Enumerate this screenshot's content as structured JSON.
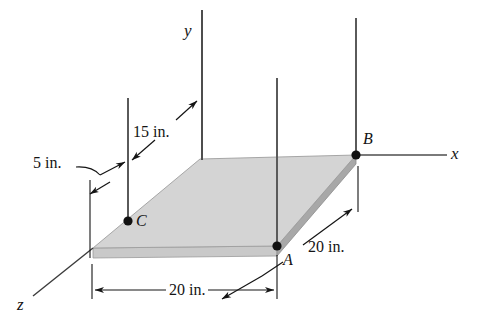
{
  "figure": {
    "type": "engineering-free-body-diagram"
  },
  "axes": {
    "x": {
      "label": "x"
    },
    "y": {
      "label": "y"
    },
    "z": {
      "label": "z"
    }
  },
  "points": [
    {
      "id": "A",
      "label": "A"
    },
    {
      "id": "B",
      "label": "B"
    },
    {
      "id": "C",
      "label": "C"
    }
  ],
  "dimensions": [
    {
      "id": "depth-bottom",
      "label": "20 in."
    },
    {
      "id": "width-right",
      "label": "20 in."
    },
    {
      "id": "offset-cable",
      "label": "15 in."
    },
    {
      "id": "offset-edge",
      "label": "5 in."
    }
  ],
  "colors": {
    "plate_top": "#d4d4d4",
    "plate_front_edge": "#c9c9c9",
    "plate_right_edge": "#a8a8a8",
    "line": "#141414",
    "cable": "#5a5a5a",
    "background": "#ffffff"
  }
}
